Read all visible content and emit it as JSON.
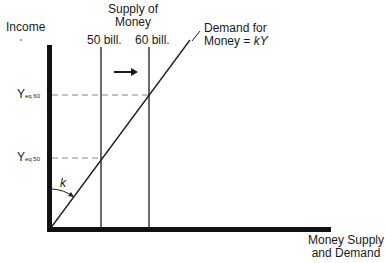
{
  "diagram": {
    "y_axis_label": "Income",
    "x_axis_label_line1": "Money Supply",
    "x_axis_label_line2": "and Demand",
    "supply_title_line1": "Supply of",
    "supply_title_line2": "Money",
    "supply_lines": [
      {
        "label": "50 bill.",
        "x": 101
      },
      {
        "label": "60 bill.",
        "x": 149
      }
    ],
    "demand_label_line1": "Demand for",
    "demand_label_line2_prefix": "Money = ",
    "demand_label_line2_var": "kY",
    "equilibria": [
      {
        "label_main": "Y",
        "label_sub": "eq 60",
        "y": 95
      },
      {
        "label_main": "Y",
        "label_sub": "eq 50",
        "y": 158
      }
    ],
    "angle_label": "k",
    "shift_arrow": "right",
    "colors": {
      "line": "#1a1a1a",
      "dash": "#777777",
      "background": "#ffffff"
    }
  }
}
